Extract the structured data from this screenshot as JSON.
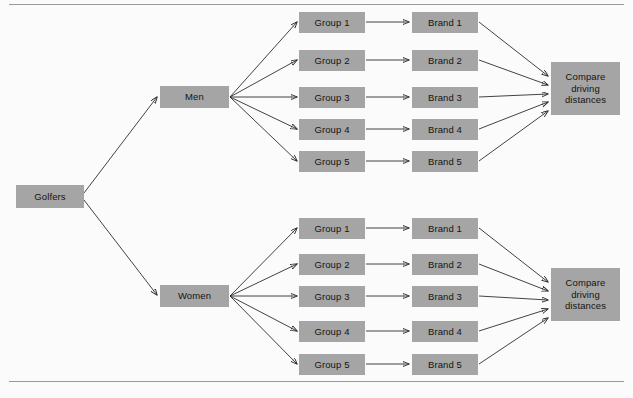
{
  "diagram": {
    "type": "tree-diagram",
    "style": {
      "node_fill": "#a5a5a5",
      "node_text": "#141414",
      "edge_color": "#2e2e2e",
      "rule_color": "#9a9a9a",
      "background": "#fbfbfb"
    },
    "rules": {
      "top_label": "top-horizontal-rule",
      "bottom_label": "bottom-horizontal-rule"
    },
    "root": {
      "label": "Golfers"
    },
    "branches": [
      {
        "id": "men",
        "label": "Men",
        "groups": [
          {
            "label": "Group 1"
          },
          {
            "label": "Group 2"
          },
          {
            "label": "Group 3"
          },
          {
            "label": "Group 4"
          },
          {
            "label": "Group 5"
          }
        ],
        "brands": [
          {
            "label": "Brand 1"
          },
          {
            "label": "Brand 2"
          },
          {
            "label": "Brand 3"
          },
          {
            "label": "Brand 4"
          },
          {
            "label": "Brand 5"
          }
        ],
        "outcome": {
          "label": "Compare driving distances"
        }
      },
      {
        "id": "women",
        "label": "Women",
        "groups": [
          {
            "label": "Group 1"
          },
          {
            "label": "Group 2"
          },
          {
            "label": "Group 3"
          },
          {
            "label": "Group 4"
          },
          {
            "label": "Group 5"
          }
        ],
        "brands": [
          {
            "label": "Brand 1"
          },
          {
            "label": "Brand 2"
          },
          {
            "label": "Brand 3"
          },
          {
            "label": "Brand 4"
          },
          {
            "label": "Brand 5"
          }
        ],
        "outcome": {
          "label": "Compare driving distances"
        }
      }
    ]
  }
}
